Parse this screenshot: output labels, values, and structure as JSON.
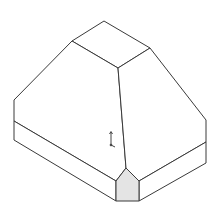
{
  "view": {
    "type": "isometric CAD line drawing",
    "background_color": "#ffffff",
    "edge_color": "#3a3a3a",
    "highlight_face_color": "#e4e4e4"
  },
  "model": {
    "name": "truncated pyramid on rectangular base",
    "faces": [
      {
        "name": "top-face"
      },
      {
        "name": "left-slope-face"
      },
      {
        "name": "right-slope-face"
      },
      {
        "name": "left-base-face"
      },
      {
        "name": "right-base-face"
      },
      {
        "name": "front-chamfer-face",
        "highlighted": true
      }
    ]
  },
  "triad": {
    "icon": "coordinate-axes-icon"
  }
}
